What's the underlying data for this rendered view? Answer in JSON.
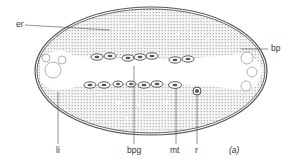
{
  "figure": {
    "panel_label": "(a)",
    "labels": {
      "er": "er",
      "bp": "bp",
      "li": "li",
      "bpg": "bpg",
      "mt": "mt",
      "r": "r"
    }
  },
  "colors": {
    "outline": "#4a4a4a",
    "stipple": "#7a7a7a",
    "lumen": "#ffffff",
    "text": "#333333"
  }
}
